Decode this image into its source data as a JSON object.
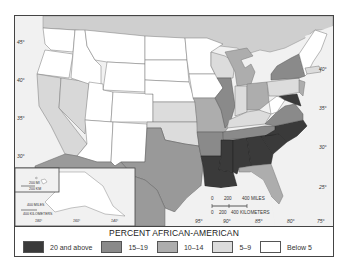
{
  "map": {
    "title": "PERCENT AFRICAN-AMERICAN",
    "latitude_ticks_left": [
      "45°",
      "40°",
      "35°",
      "30°"
    ],
    "latitude_ticks_right": [
      "40°",
      "35°",
      "30°",
      "25°"
    ],
    "longitude_ticks_bottom": [
      "95°",
      "90°",
      "85°",
      "80°",
      "75°"
    ],
    "scale_bar": {
      "miles_labels": [
        "0",
        "200",
        "400 MILES"
      ],
      "km_labels": [
        "0",
        "200",
        "400 KILOMETERS"
      ]
    },
    "alaska_inset": {
      "miles_label": "400 MILES",
      "km_label": "400 KILOMETERS",
      "longitude_ticks": [
        "180°",
        "160°",
        "140°"
      ]
    },
    "hawaii_inset": {
      "miles_label": "200 MI",
      "km_label": "200 KM"
    }
  },
  "legend": {
    "title": "PERCENT AFRICAN-AMERICAN",
    "items": [
      {
        "label": "20 and above",
        "color": "#3a3a3a"
      },
      {
        "label": "15–19",
        "color": "#8a8a8a"
      },
      {
        "label": "10–14",
        "color": "#adadad"
      },
      {
        "label": "5–9",
        "color": "#dcdcdc"
      },
      {
        "label": "Below 5",
        "color": "#ffffff"
      }
    ]
  },
  "state_categories": {
    "20 and above": [
      "Mississippi",
      "Louisiana",
      "Alabama",
      "Georgia",
      "South Carolina",
      "North Carolina",
      "Maryland",
      "Delaware"
    ],
    "15–19": [
      "Virginia",
      "Tennessee",
      "Arkansas",
      "Illinois",
      "New York",
      "Texas"
    ],
    "10–14": [
      "Michigan",
      "Ohio",
      "Missouri",
      "Florida",
      "New Jersey",
      "California",
      "Nevada"
    ],
    "5–9": [
      "Pennsylvania",
      "Indiana",
      "Kentucky",
      "Oklahoma",
      "Kansas",
      "Connecticut",
      "Wisconsin"
    ],
    "Below 5": [
      "Washington",
      "Oregon",
      "Idaho",
      "Montana",
      "Wyoming",
      "Utah",
      "Colorado",
      "Arizona",
      "New Mexico",
      "North Dakota",
      "South Dakota",
      "Nebraska",
      "Minnesota",
      "Iowa",
      "West Virginia",
      "Maine",
      "Vermont",
      "New Hampshire",
      "Alaska",
      "Hawaii"
    ]
  }
}
